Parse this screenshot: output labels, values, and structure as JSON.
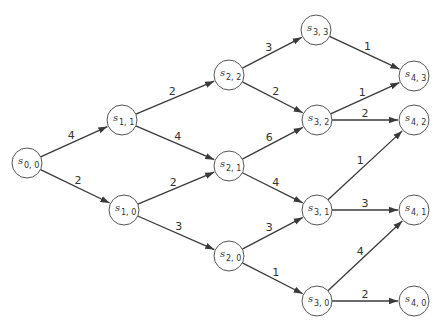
{
  "diagram": {
    "type": "directed-weighted-graph",
    "nodes": [
      {
        "id": "s00",
        "label": "s",
        "sub": "0, 0",
        "x": 27,
        "y": 163
      },
      {
        "id": "s11",
        "label": "s",
        "sub": "1, 1",
        "x": 122,
        "y": 120
      },
      {
        "id": "s10",
        "label": "s",
        "sub": "1, 0",
        "x": 124,
        "y": 210
      },
      {
        "id": "s22",
        "label": "s",
        "sub": "2, 2",
        "x": 229,
        "y": 75
      },
      {
        "id": "s21",
        "label": "s",
        "sub": "2, 1",
        "x": 229,
        "y": 166
      },
      {
        "id": "s20",
        "label": "s",
        "sub": "2, 0",
        "x": 229,
        "y": 256
      },
      {
        "id": "s33",
        "label": "s",
        "sub": "3, 3",
        "x": 316,
        "y": 30
      },
      {
        "id": "s32",
        "label": "s",
        "sub": "3, 2",
        "x": 317,
        "y": 120
      },
      {
        "id": "s31",
        "label": "s",
        "sub": "3, 1",
        "x": 317,
        "y": 210
      },
      {
        "id": "s30",
        "label": "s",
        "sub": "3, 0",
        "x": 317,
        "y": 301
      },
      {
        "id": "s43",
        "label": "s",
        "sub": "4, 3",
        "x": 414,
        "y": 76
      },
      {
        "id": "s42",
        "label": "s",
        "sub": "4, 2",
        "x": 414,
        "y": 120
      },
      {
        "id": "s41",
        "label": "s",
        "sub": "4, 1",
        "x": 414,
        "y": 210
      },
      {
        "id": "s40",
        "label": "s",
        "sub": "4, 0",
        "x": 414,
        "y": 301
      }
    ],
    "edges": [
      {
        "from": "s00",
        "to": "s11",
        "weight": "4"
      },
      {
        "from": "s00",
        "to": "s10",
        "weight": "2"
      },
      {
        "from": "s11",
        "to": "s22",
        "weight": "2"
      },
      {
        "from": "s11",
        "to": "s21",
        "weight": "4"
      },
      {
        "from": "s10",
        "to": "s21",
        "weight": "2"
      },
      {
        "from": "s10",
        "to": "s20",
        "weight": "3"
      },
      {
        "from": "s22",
        "to": "s33",
        "weight": "3"
      },
      {
        "from": "s22",
        "to": "s32",
        "weight": "2"
      },
      {
        "from": "s21",
        "to": "s32",
        "weight": "6"
      },
      {
        "from": "s21",
        "to": "s31",
        "weight": "4"
      },
      {
        "from": "s20",
        "to": "s31",
        "weight": "3"
      },
      {
        "from": "s20",
        "to": "s30",
        "weight": "1"
      },
      {
        "from": "s33",
        "to": "s43",
        "weight": "1"
      },
      {
        "from": "s32",
        "to": "s43",
        "weight": "1"
      },
      {
        "from": "s32",
        "to": "s42",
        "weight": "2"
      },
      {
        "from": "s31",
        "to": "s42",
        "weight": "1"
      },
      {
        "from": "s31",
        "to": "s41",
        "weight": "3"
      },
      {
        "from": "s30",
        "to": "s41",
        "weight": "4"
      },
      {
        "from": "s30",
        "to": "s40",
        "weight": "2"
      }
    ]
  }
}
